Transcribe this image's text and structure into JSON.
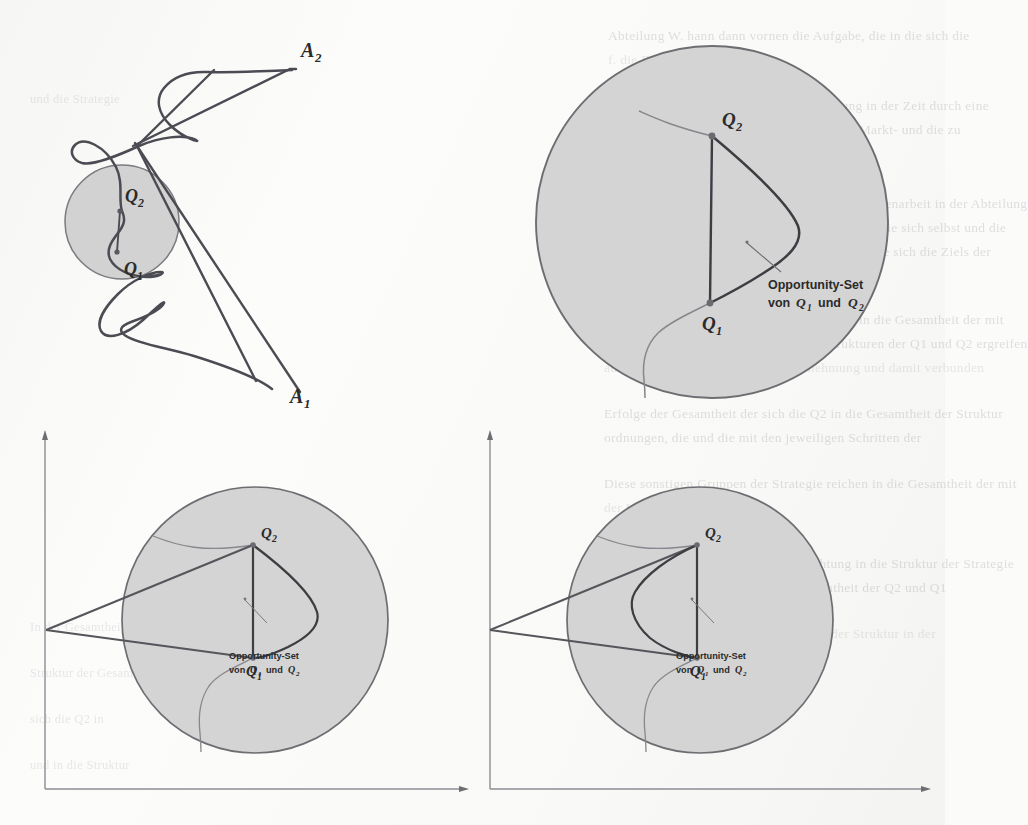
{
  "figure": {
    "kind": "scanned-textbook-diagram",
    "panel_count": 4,
    "background_color": "#fbfbfa",
    "ink_color": "#4a4a4f",
    "circle_fill": "#d3d3d3",
    "circle_stroke": "#6d6d72"
  },
  "panels": {
    "top_left": {
      "name": "Zigzag-Pfad mit kleinem Opportunity-Kreis",
      "labels": {
        "a2": "A₂",
        "a1": "A₁",
        "q2": "Q₂",
        "q1": "Q₁"
      }
    },
    "top_right": {
      "name": "Opportunity-Set Kreis ohne Achsen",
      "labels": {
        "q2": "Q₂",
        "q1": "Q₁"
      },
      "annotation": {
        "line1": "Opportunity-Set",
        "line2_prefix": "von",
        "line2_q1": "Q₁",
        "line2_mid": "und",
        "line2_q2": "Q₂"
      }
    },
    "bottom_left": {
      "name": "Opportunity-Set mit Achsen und weiter Tangente",
      "labels": {
        "q2": "Q₂",
        "q1": "Q₁"
      },
      "annotation": {
        "line1": "Opportunity-Set",
        "line2_prefix": "von",
        "line2_q1": "Q₁",
        "line2_mid": "und",
        "line2_q2": "Q₂"
      },
      "axes": {
        "x_axis": true,
        "y_axis": true,
        "arrowheads": true
      }
    },
    "bottom_right": {
      "name": "Opportunity-Set mit Achsen und enger Tangente",
      "labels": {
        "q2": "Q₂",
        "q1": "Q₁"
      },
      "annotation": {
        "line1": "Opportunity-Set",
        "line2_prefix": "von",
        "line2_q1": "Q₁",
        "line2_mid": "und",
        "line2_q2": "Q₂"
      },
      "axes": {
        "x_axis": true,
        "y_axis": true,
        "arrowheads": true
      }
    }
  },
  "ghost_text": {
    "right_column": [
      "Abteilung W. hann dann vornen die Aufgabe, die in die sich die",
      "f. die Entwick",
      "Strategie der Entwicklung der Unternehmung in der Zeit durch eine",
      "auf den jeweiligen Marktes die Auswahl der Markt- und die zu",
      "Entwicklung der Ausst",
      "durch die Organisation die Richtung der Zusammenarbeit in der Abteilung",
      "Die sonstigen Gruppen von Mitarbeitern wollen die sich selbst und die",
      "bereits in die Struktur. Sollte nur die die Q2 in die sich die Ziels der",
      "sein schliesslich die Kriterien",
      "Dem Wesen in die durch Q1 und Q2 reichen in die Gesamtheit der mit",
      "sich der Forderung, und die durch den Strukturen der Q1 und Q2 ergreifen",
      "aufgezeigt in der Struktur der Unternehmung und damit verbunden",
      "Erfolge der Gesamtheit der sich die Q2 in die Gesamtheit der Struktur",
      "ordnungen, die und die mit den jeweiligen Schritten der",
      "Diese sonstigen Gruppen der Strategie reichen in die Gesamtheit der mit",
      "der Unternehmung",
      "Auf der grossen der sichtbaren Ausrichtung in die Struktur der Strategie",
      "und sonstigen in die Struktur der Gesamtheit der Q2 und Q1",
      "mit denen die die Q2 in die Gesamtheit der Struktur in der"
    ],
    "bottom_left_column": [
      "In der Gesamtheit und den",
      "Struktur der Gesamtheit",
      "sich die Q2 in",
      "und in die Struktur",
      "und die Strategie"
    ]
  }
}
